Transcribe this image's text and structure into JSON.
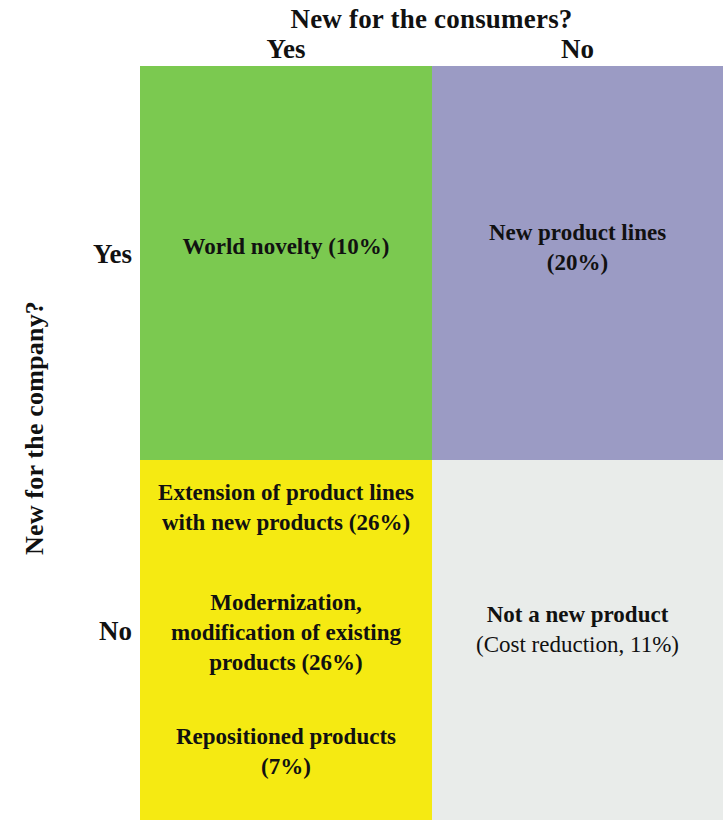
{
  "axes": {
    "column_axis_title": "New for the consumers?",
    "row_axis_title": "New for the company?",
    "column_headers": [
      "Yes",
      "No"
    ],
    "row_headers": [
      "Yes",
      "No"
    ]
  },
  "colors": {
    "quadrant_new_new": "#7bc950",
    "quadrant_new_existing": "#9b9bc4",
    "quadrant_existing_new": "#f5ea12",
    "quadrant_existing_existing": "#e9ecea",
    "text": "#111111",
    "background": "#ffffff"
  },
  "matrix": {
    "quadrant_top_left": {
      "label": "World novelty (10%)",
      "percent": "10%"
    },
    "quadrant_top_right": {
      "label": "New product lines (20%)",
      "line1": "New product lines",
      "line2": "(20%)",
      "percent": "20%"
    },
    "quadrant_bottom_left": {
      "item_1": "Extension of product lines with new products (26%)",
      "item_2": "Modernization, modification of existing products (26%)",
      "item_3": "Repositioned products (7%)",
      "percent_1": "26%",
      "percent_2": "26%",
      "percent_3": "7%"
    },
    "quadrant_bottom_right": {
      "label": "Not a new product",
      "sublabel": "(Cost reduction, 11%)",
      "percent": "11%"
    }
  }
}
